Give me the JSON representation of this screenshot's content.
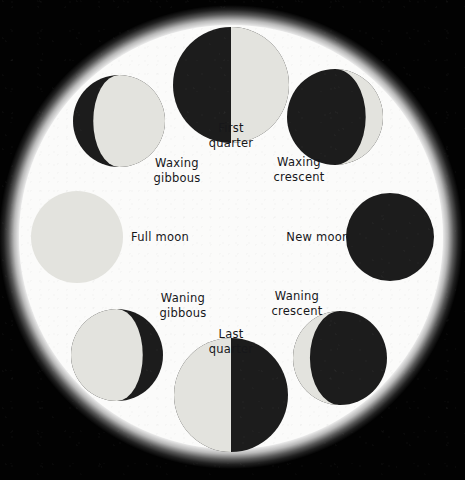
{
  "diagram": {
    "background_color": "#000000",
    "disc_color": "#fbfbfa",
    "lit_color": "#e3e3de",
    "dark_color": "#1c1c1c",
    "label_color": "#17171a"
  },
  "phases": [
    {
      "id": "first-quarter",
      "label_line1": "First",
      "label_line2": "quarter",
      "illumination_pct": 50,
      "lit_side": "right",
      "shape": "half",
      "moon_cx": 231,
      "moon_cy": 85,
      "moon_r": 58,
      "label_x": 231,
      "label_y": 135
    },
    {
      "id": "waxing-gibbous",
      "label_line1": "Waxing",
      "label_line2": "gibbous",
      "illumination_pct": 78,
      "lit_side": "right",
      "shape": "gibbous",
      "moon_cx": 119,
      "moon_cy": 121,
      "moon_r": 46,
      "label_x": 177,
      "label_y": 170
    },
    {
      "id": "waxing-crescent",
      "label_line1": "Waxing",
      "label_line2": "crescent",
      "illumination_pct": 18,
      "lit_side": "right",
      "shape": "crescent",
      "moon_cx": 335,
      "moon_cy": 117,
      "moon_r": 48,
      "label_x": 299,
      "label_y": 169
    },
    {
      "id": "full-moon",
      "label_line1": "Full moon",
      "label_line2": "",
      "illumination_pct": 100,
      "lit_side": "all",
      "shape": "full",
      "moon_cx": 77,
      "moon_cy": 237,
      "moon_r": 46,
      "label_x": 160,
      "label_y": 237
    },
    {
      "id": "new-moon",
      "label_line1": "New moon",
      "label_line2": "",
      "illumination_pct": 0,
      "lit_side": "none",
      "shape": "new",
      "moon_cx": 390,
      "moon_cy": 237,
      "moon_r": 44,
      "label_x": 318,
      "label_y": 237
    },
    {
      "id": "waning-gibbous",
      "label_line1": "Waning",
      "label_line2": "gibbous",
      "illumination_pct": 78,
      "lit_side": "left",
      "shape": "gibbous",
      "moon_cx": 117,
      "moon_cy": 355,
      "moon_r": 46,
      "label_x": 183,
      "label_y": 305
    },
    {
      "id": "waning-crescent",
      "label_line1": "Waning",
      "label_line2": "crescent",
      "illumination_pct": 18,
      "lit_side": "left",
      "shape": "crescent",
      "moon_cx": 340,
      "moon_cy": 358,
      "moon_r": 47,
      "label_x": 297,
      "label_y": 303
    },
    {
      "id": "last-quarter",
      "label_line1": "Last",
      "label_line2": "quarter",
      "illumination_pct": 50,
      "lit_side": "left",
      "shape": "half",
      "moon_cx": 231,
      "moon_cy": 395,
      "moon_r": 57,
      "label_x": 231,
      "label_y": 341
    }
  ]
}
